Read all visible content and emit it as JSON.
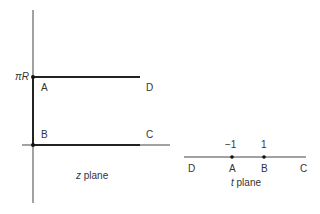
{
  "z_plane": {
    "caption_var": "z",
    "caption_rest": " plane",
    "y_tick_label": "πR",
    "points": {
      "A": "A",
      "B": "B",
      "C": "C",
      "D": "D"
    }
  },
  "t_plane": {
    "caption_var": "t",
    "caption_rest": " plane",
    "ticks": [
      "−1",
      "1"
    ],
    "points": {
      "D": "D",
      "A": "A",
      "B": "B",
      "C": "C"
    }
  }
}
